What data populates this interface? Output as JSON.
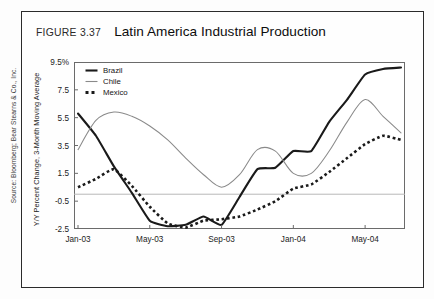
{
  "figure": {
    "number_label": "FIGURE 3.37",
    "title": "Latin America Industrial Production",
    "source": "Source: Bloomberg; Bear Stearns & Co., Inc."
  },
  "legend": {
    "position": "top-left-inside",
    "items": [
      {
        "label": "Brazil",
        "color": "#1a1a1a",
        "style": "solid-thick"
      },
      {
        "label": "Chile",
        "color": "#8a8a8a",
        "style": "solid-thin"
      },
      {
        "label": "Mexico",
        "color": "#1a1a1a",
        "style": "dotted-thick"
      }
    ]
  },
  "axes": {
    "y_title": "Y/Y Percent Change, 3-Month Moving Average",
    "y_ticks": [
      "9.5%",
      "7.5",
      "5.5",
      "3.5",
      "1.5",
      "-0.5",
      "-2.5"
    ],
    "x_ticks": [
      "Jan-03",
      "May-03",
      "Sep-03",
      "Jan-04",
      "May-04"
    ]
  },
  "chart_data": {
    "type": "line",
    "title": "Latin America Industrial Production",
    "xlabel": "",
    "ylabel": "Y/Y Percent Change, 3-Month Moving Average",
    "ylim": [
      -2.5,
      9.5
    ],
    "ytick_values": [
      9.5,
      7.5,
      5.5,
      3.5,
      1.5,
      -0.5,
      -2.5
    ],
    "grid": "zero-line-only",
    "zero_line": 0,
    "legend_position": "top-left",
    "x": [
      "Jan-03",
      "Feb-03",
      "Mar-03",
      "Apr-03",
      "May-03",
      "Jun-03",
      "Jul-03",
      "Aug-03",
      "Sep-03",
      "Oct-03",
      "Nov-03",
      "Dec-03",
      "Jan-04",
      "Feb-04",
      "Mar-04",
      "Apr-04",
      "May-04",
      "Jun-04",
      "Jul-04"
    ],
    "x_tick_labels": [
      "Jan-03",
      "May-03",
      "Sep-03",
      "Jan-04",
      "May-04"
    ],
    "x_tick_indices": [
      0,
      4,
      8,
      12,
      16
    ],
    "series": [
      {
        "name": "Brazil",
        "color": "#1a1a1a",
        "style": "solid",
        "width": 2.1,
        "values": [
          5.8,
          4.2,
          2.0,
          0.1,
          -1.9,
          -2.3,
          -2.2,
          -1.6,
          -2.2,
          -0.2,
          1.8,
          1.9,
          3.1,
          3.1,
          5.2,
          6.8,
          8.6,
          9.0,
          9.1
        ]
      },
      {
        "name": "Chile",
        "color": "#8a8a8a",
        "style": "solid",
        "width": 1.05,
        "values": [
          3.2,
          5.3,
          5.9,
          5.6,
          4.9,
          3.9,
          2.6,
          1.4,
          0.5,
          1.4,
          3.2,
          3.1,
          1.5,
          1.5,
          3.1,
          5.2,
          6.8,
          5.6,
          4.4
        ]
      },
      {
        "name": "Mexico",
        "color": "#1a1a1a",
        "style": "dotted",
        "width": 2.6,
        "values": [
          0.5,
          1.1,
          1.8,
          0.6,
          -0.9,
          -2.1,
          -2.4,
          -1.9,
          -1.8,
          -1.6,
          -1.1,
          -0.5,
          0.4,
          0.7,
          1.6,
          2.6,
          3.6,
          4.2,
          3.9
        ]
      }
    ]
  }
}
